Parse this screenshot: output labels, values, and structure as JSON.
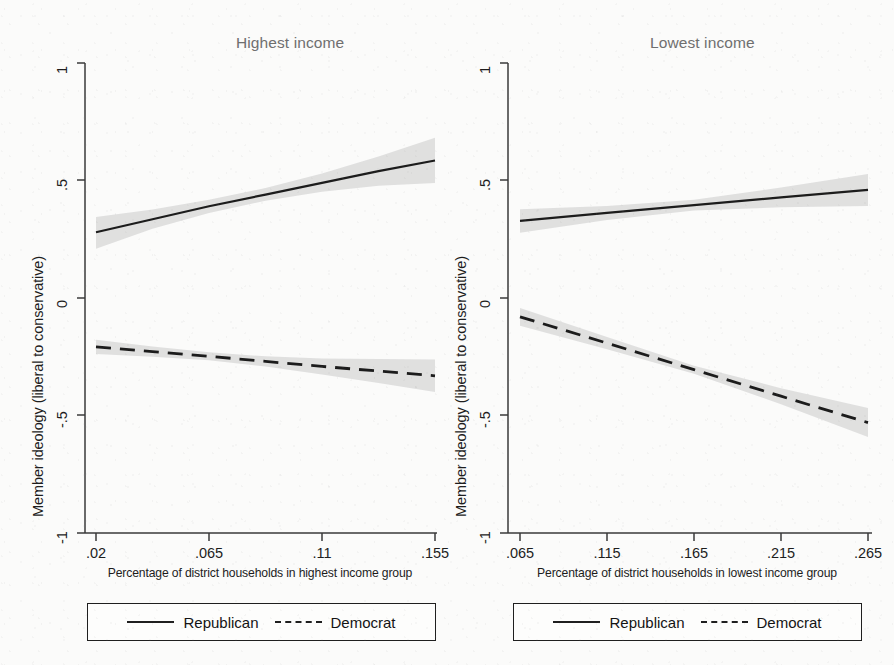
{
  "figure": {
    "background_color": "#fbfbfa",
    "ink_color": "#1c1c1c",
    "band_color": "#cfcfcf",
    "title_color": "#6f6f6f"
  },
  "chart_data": [
    {
      "type": "line",
      "panel_id": "highest-income",
      "title": "Highest income",
      "xlabel": "Percentage of district households in highest income group",
      "ylabel": "Member ideology (liberal to conservative)",
      "xlim": [
        0.02,
        0.155
      ],
      "ylim": [
        -1,
        1
      ],
      "xticks": [
        0.02,
        0.065,
        0.11,
        0.155
      ],
      "xtick_labels": [
        ".02",
        ".065",
        ".11",
        ".155"
      ],
      "yticks": [
        1,
        0.5,
        0,
        -0.5,
        -1
      ],
      "ytick_labels": [
        "1",
        ".5",
        "0",
        "-.5",
        "-1"
      ],
      "grid": false,
      "legend_position": "below",
      "series": [
        {
          "name": "Republican",
          "style": "solid",
          "x": [
            0.02,
            0.0425,
            0.065,
            0.0875,
            0.11,
            0.1325,
            0.155
          ],
          "values": [
            0.28,
            0.335,
            0.39,
            0.44,
            0.49,
            0.54,
            0.585
          ],
          "ci_lower": [
            0.21,
            0.295,
            0.362,
            0.414,
            0.452,
            0.478,
            0.49
          ],
          "ci_upper": [
            0.345,
            0.377,
            0.418,
            0.468,
            0.53,
            0.602,
            0.682
          ]
        },
        {
          "name": "Democrat",
          "style": "dashed",
          "x": [
            0.02,
            0.0425,
            0.065,
            0.0875,
            0.11,
            0.1325,
            0.155
          ],
          "values": [
            -0.208,
            -0.228,
            -0.248,
            -0.27,
            -0.291,
            -0.311,
            -0.331
          ],
          "ci_lower": [
            -0.238,
            -0.25,
            -0.265,
            -0.292,
            -0.325,
            -0.362,
            -0.4
          ],
          "ci_upper": [
            -0.178,
            -0.206,
            -0.231,
            -0.248,
            -0.258,
            -0.26,
            -0.262
          ]
        }
      ]
    },
    {
      "type": "line",
      "panel_id": "lowest-income",
      "title": "Lowest income",
      "xlabel": "Percentage of district households in lowest income group",
      "ylabel": "Member ideology (liberal to conservative)",
      "xlim": [
        0.065,
        0.265
      ],
      "ylim": [
        -1,
        1
      ],
      "xticks": [
        0.065,
        0.115,
        0.165,
        0.215,
        0.265
      ],
      "xtick_labels": [
        ".065",
        ".115",
        ".165",
        ".215",
        ".265"
      ],
      "yticks": [
        1,
        0.5,
        0,
        -0.5,
        -1
      ],
      "ytick_labels": [
        "1",
        ".5",
        "0",
        "-.5",
        "-1"
      ],
      "grid": false,
      "legend_position": "below",
      "series": [
        {
          "name": "Republican",
          "style": "solid",
          "x": [
            0.065,
            0.115,
            0.165,
            0.215,
            0.265
          ],
          "values": [
            0.328,
            0.362,
            0.395,
            0.428,
            0.46
          ],
          "ci_lower": [
            0.278,
            0.332,
            0.372,
            0.386,
            0.392
          ],
          "ci_upper": [
            0.378,
            0.392,
            0.418,
            0.47,
            0.528
          ]
        },
        {
          "name": "Democrat",
          "style": "dashed",
          "x": [
            0.065,
            0.115,
            0.165,
            0.215,
            0.265
          ],
          "values": [
            -0.08,
            -0.192,
            -0.305,
            -0.418,
            -0.53
          ],
          "ci_lower": [
            -0.118,
            -0.218,
            -0.322,
            -0.452,
            -0.592
          ],
          "ci_upper": [
            -0.042,
            -0.166,
            -0.288,
            -0.384,
            -0.468
          ]
        }
      ]
    }
  ],
  "legend": {
    "entries": [
      {
        "label": "Republican",
        "style": "solid"
      },
      {
        "label": "Democrat",
        "style": "dashed"
      }
    ]
  }
}
